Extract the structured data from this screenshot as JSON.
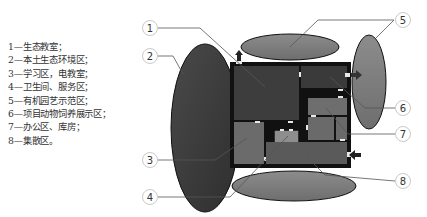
{
  "legend": {
    "items": [
      {
        "number": "1",
        "text": "1—生态教室；"
      },
      {
        "number": "2",
        "text": "2—本土生态环境区；"
      },
      {
        "number": "3",
        "text": "3—学习区，电教室；"
      },
      {
        "number": "4",
        "text": "4—卫生间、服务区；"
      },
      {
        "number": "5",
        "text": "5—有机园艺示范区；"
      },
      {
        "number": "6",
        "text": "6—项目动物饲养展示区；"
      },
      {
        "number": "7",
        "text": "7—办公区、库房；"
      },
      {
        "number": "8",
        "text": "8—集散区。"
      }
    ]
  },
  "diagram": {
    "callouts": [
      {
        "id": "1",
        "label": "1"
      },
      {
        "id": "2",
        "label": "2"
      },
      {
        "id": "3",
        "label": "3"
      },
      {
        "id": "4",
        "label": "4"
      },
      {
        "id": "5",
        "label": "5"
      },
      {
        "id": "6",
        "label": "6"
      },
      {
        "id": "7",
        "label": "7"
      },
      {
        "id": "8",
        "label": "8"
      }
    ],
    "colors": {
      "outer_wall": "#111111",
      "dark_room": "#3a3a3a",
      "mid_room": "#6b6b6b",
      "light_room": "#8e8e8e",
      "ellipse_dark": "#3c3c3c",
      "ellipse_mid": "#808080",
      "door": "#e8e8e8",
      "leader": "#444444"
    }
  }
}
